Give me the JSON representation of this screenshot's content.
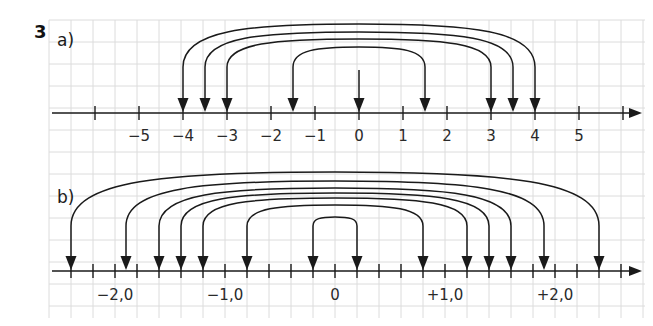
{
  "exercise_number": "3",
  "parts": [
    {
      "label": "a)",
      "axis": {
        "unit_px": 44,
        "zero_x": 359,
        "y": 113,
        "x_start": 52,
        "x_end": 642,
        "tick_values": [
          -6,
          -5,
          -4,
          -3,
          -2,
          -1,
          0,
          1,
          2,
          3,
          4,
          5,
          6
        ],
        "tick_labels": [
          {
            "value": -5,
            "text": "−5"
          },
          {
            "value": -4,
            "text": "−4"
          },
          {
            "value": -3,
            "text": "−3"
          },
          {
            "value": -2,
            "text": "−2"
          },
          {
            "value": -1,
            "text": "−1"
          },
          {
            "value": 0,
            "text": "0"
          },
          {
            "value": 1,
            "text": "1"
          },
          {
            "value": 2,
            "text": "2"
          },
          {
            "value": 3,
            "text": "3"
          },
          {
            "value": 4,
            "text": "4"
          },
          {
            "value": 5,
            "text": "5"
          }
        ],
        "label_y": 141
      },
      "pairs": [
        {
          "left": -4,
          "right": 4,
          "top_y": 24
        },
        {
          "left": -3.5,
          "right": 3.5,
          "top_y": 32
        },
        {
          "left": -3,
          "right": 3,
          "top_y": 39
        },
        {
          "left": -1.5,
          "right": 1.5,
          "top_y": 47
        }
      ],
      "single_arrows": [
        {
          "value": 0,
          "start_y": 70
        }
      ],
      "stem_top_y": 67
    },
    {
      "label": "b)",
      "axis": {
        "unit_px": 110,
        "zero_x": 335,
        "y": 271,
        "x_start": 52,
        "x_end": 642,
        "tick_step": 0.2,
        "tick_values": [
          -2.6,
          -2.4,
          -2.2,
          -2.0,
          -1.8,
          -1.6,
          -1.4,
          -1.2,
          -1.0,
          -0.8,
          -0.6,
          -0.4,
          -0.2,
          0,
          0.2,
          0.4,
          0.6,
          0.8,
          1.0,
          1.2,
          1.4,
          1.6,
          1.8,
          2.0,
          2.2,
          2.4,
          2.6
        ],
        "tick_labels": [
          {
            "value": -2.0,
            "text": "−2,0"
          },
          {
            "value": -1.0,
            "text": "−1,0"
          },
          {
            "value": 0,
            "text": "0"
          },
          {
            "value": 1.0,
            "text": "+1,0"
          },
          {
            "value": 2.0,
            "text": "+2,0"
          }
        ],
        "label_y": 300
      },
      "pairs": [
        {
          "left": -2.4,
          "right": 2.4,
          "top_y": 172
        },
        {
          "left": -1.9,
          "right": 1.9,
          "top_y": 181
        },
        {
          "left": -1.6,
          "right": 1.6,
          "top_y": 188
        },
        {
          "left": -1.4,
          "right": 1.4,
          "top_y": 193
        },
        {
          "left": -1.2,
          "right": 1.2,
          "top_y": 198
        },
        {
          "left": -0.8,
          "right": 0.8,
          "top_y": 205
        },
        {
          "left": -0.2,
          "right": 0.2,
          "top_y": 217
        }
      ],
      "single_arrows": [],
      "stem_top_y": 226
    }
  ],
  "grid": {
    "x0": 49,
    "y0": 20,
    "x1": 645,
    "y1": 318,
    "step": 22,
    "color": "#dcdcdc"
  },
  "colors": {
    "ink": "#1a1a1a",
    "background": "#ffffff"
  }
}
